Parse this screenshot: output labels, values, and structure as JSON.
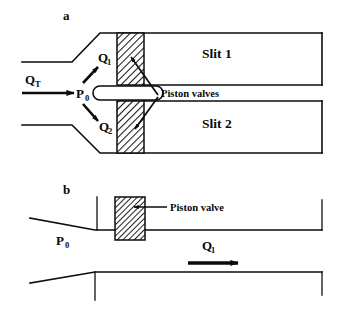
{
  "figure": {
    "type": "schematic-diagram",
    "background_color": "#ffffff",
    "line_color": "#0d0d0d",
    "hatch_color": "#1a1a1a"
  },
  "panel_a": {
    "label": "a",
    "inlet_flow_label": {
      "base": "Q",
      "sub": "T"
    },
    "pressure_label": {
      "base": "P",
      "sub": "0"
    },
    "branch_upper_label": {
      "base": "Q",
      "sub": "1"
    },
    "branch_lower_label": {
      "base": "Q",
      "sub": "2"
    },
    "slit_upper_label": "Slit 1",
    "slit_lower_label": "Slit 2",
    "valve_callout": "Piston valves"
  },
  "panel_b": {
    "label": "b",
    "pressure_label": {
      "base": "P",
      "sub": "0"
    },
    "flow_label": {
      "base": "Q",
      "sub": "1"
    },
    "valve_callout": "Piston valve"
  }
}
